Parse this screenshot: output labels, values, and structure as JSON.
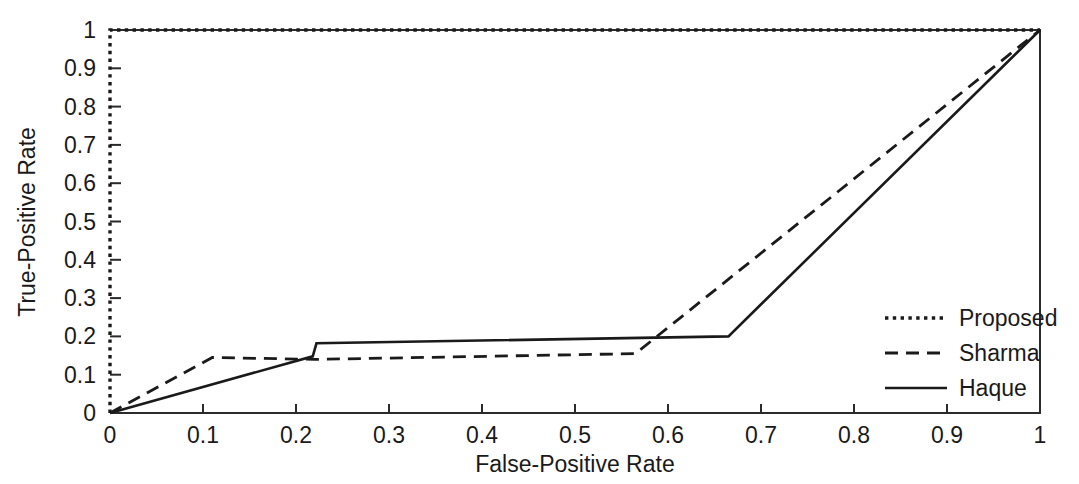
{
  "chart_data": {
    "type": "line",
    "title": "",
    "subtitle": "",
    "xlabel": "False-Positive Rate",
    "ylabel": "True-Positive Rate",
    "xlim": [
      0,
      1
    ],
    "ylim": [
      0,
      1
    ],
    "grid": false,
    "legend_position": "right-inside",
    "xticks": [
      0,
      0.1,
      0.2,
      0.3,
      0.4,
      0.5,
      0.6,
      0.7,
      0.8,
      0.9,
      1
    ],
    "xtick_labels": [
      "0",
      "0.1",
      "0.2",
      "0.3",
      "0.4",
      "0.5",
      "0.6",
      "0.7",
      "0.8",
      "0.9",
      "1"
    ],
    "yticks": [
      0,
      0.1,
      0.2,
      0.3,
      0.4,
      0.5,
      0.6,
      0.7,
      0.8,
      0.9,
      1
    ],
    "ytick_labels": [
      "0",
      "0.1",
      "0.2",
      "0.3",
      "0.4",
      "0.5",
      "0.6",
      "0.7",
      "0.8",
      "0.9",
      "1"
    ],
    "series": [
      {
        "name": "Proposed",
        "style": "dotted",
        "color": "#1a1a1a",
        "points": [
          [
            0,
            0
          ],
          [
            0,
            1
          ],
          [
            1,
            1
          ]
        ]
      },
      {
        "name": "Sharma",
        "style": "dashed",
        "color": "#1a1a1a",
        "points": [
          [
            0,
            0
          ],
          [
            0.11,
            0.145
          ],
          [
            0.22,
            0.14
          ],
          [
            0.565,
            0.155
          ],
          [
            1,
            1
          ]
        ]
      },
      {
        "name": "Haque",
        "style": "solid",
        "color": "#1a1a1a",
        "points": [
          [
            0,
            0
          ],
          [
            0.218,
            0.148
          ],
          [
            0.222,
            0.182
          ],
          [
            0.665,
            0.2
          ],
          [
            1,
            1
          ]
        ]
      }
    ]
  },
  "legend": {
    "entries": [
      {
        "label": "Proposed",
        "style": "dotted"
      },
      {
        "label": "Sharma",
        "style": "dashed"
      },
      {
        "label": "Haque",
        "style": "solid"
      }
    ]
  },
  "axes": {
    "x_title": "False-Positive Rate",
    "y_title": "True-Positive Rate"
  }
}
